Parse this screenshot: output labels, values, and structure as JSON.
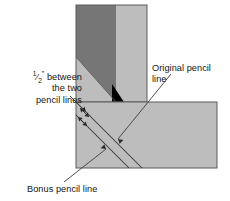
{
  "figure": {
    "background_color": "#ffffff",
    "line_color": "#3c3c3c"
  },
  "boards": {
    "vertical": {
      "name": "vertical board",
      "dark_face_color": "#767676",
      "light_face_color": "#bdbdbd",
      "outline_color": "#5a5a5a",
      "notch_color": "#000000"
    },
    "horizontal": {
      "name": "horizontal board",
      "face_color": "#bdbdbd",
      "outline_color": "#5a5a5a"
    }
  },
  "labels": {
    "gap": {
      "fraction_numerator": "1",
      "fraction_slash": "⁄",
      "fraction_denominator": "2",
      "inch_mark": "”",
      "line1_rest": " between",
      "line2": "the two",
      "line3": "pencil lines"
    },
    "original": {
      "line1": "Original pencil",
      "line2": "line"
    },
    "bonus": {
      "line1": "Bonus pencil line"
    }
  },
  "annotations": {
    "measure_arrows": 2,
    "pencil_lines": 2
  }
}
